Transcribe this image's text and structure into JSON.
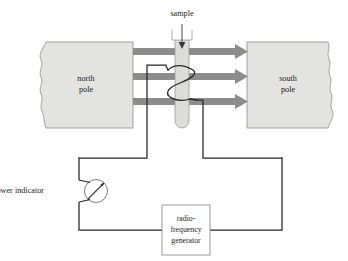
{
  "figure": {
    "background_color": "#ffffff"
  },
  "labels": {
    "sample": "sample",
    "north_pole_line1": "north",
    "north_pole_line2": "pole",
    "south_pole_line1": "south",
    "south_pole_line2": "pole",
    "power_indicator": "power indicator",
    "generator_line1": "radio-",
    "generator_line2": "frequency",
    "generator_line3": "generator"
  },
  "colors": {
    "pole_fill": "#e3e3e1",
    "pole_stroke": "#8e8e8e",
    "field_arrow": "#8c8c8c",
    "tube_fill": "#dcdcda",
    "tube_stroke": "#9a9a9a",
    "wire": "#262626",
    "box_stroke": "#8e8e8e",
    "text": "#1a1a1a"
  },
  "magnet": {
    "north_pole": {
      "x": 40,
      "y": 42,
      "width": 93,
      "height": 86
    },
    "south_pole": {
      "x": 247,
      "y": 42,
      "width": 86,
      "height": 86
    }
  },
  "field_arrows": {
    "count": 3,
    "y_positions": [
      51.5,
      76.5,
      101.5
    ],
    "x_start": 133,
    "x_end": 248,
    "thickness": 7,
    "head_length": 13,
    "head_half_height": 7.5,
    "direction": "right"
  },
  "sample_tube": {
    "x": 175,
    "y_top": 30,
    "width": 14,
    "y_bottom": 128,
    "rim_prong_height": 10,
    "fill_arrow_y_top": 24,
    "fill_arrow_y_bottom": 47
  },
  "coil": {
    "turns": 2,
    "y_top": 64,
    "y_bottom": 100,
    "lead_left_x": 147,
    "lead_right_x": 203
  },
  "power_indicator": {
    "center_x": 96,
    "center_y": 191,
    "radius": 11.5,
    "needle_angle_deg": -45
  },
  "generator_box": {
    "x": 162,
    "y": 205,
    "width": 48,
    "height": 50
  },
  "circuit": {
    "left_rail_x": 79,
    "right_rail_x": 282,
    "top_y": 158,
    "bottom_y": 230,
    "coil_top_lead_x": 147,
    "coil_top_lead_y": 64,
    "coil_bottom_lead_x": 203,
    "coil_bottom_lead_y": 100
  }
}
